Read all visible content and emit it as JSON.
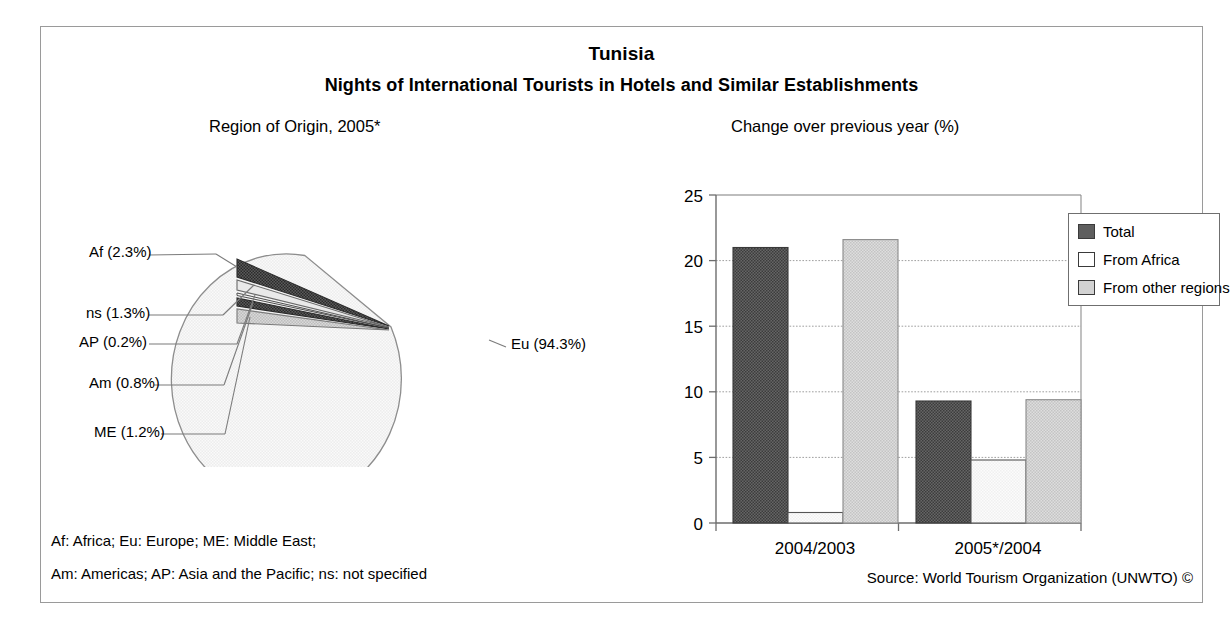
{
  "header": {
    "country": "Tunisia",
    "subtitle": "Nights of International Tourists in Hotels and Similar Establishments"
  },
  "pie_panel": {
    "caption": "Region of Origin, 2005*",
    "labels": {
      "af": "Af (2.3%)",
      "ns": "ns (1.3%)",
      "ap": "AP (0.2%)",
      "am": "Am (0.8%)",
      "me": "ME (1.2%)",
      "eu": "Eu (94.3%)"
    }
  },
  "bar_panel": {
    "caption": "Change over previous year (%)",
    "legend": [
      {
        "label": "Total",
        "color": "#585858"
      },
      {
        "label": "From Africa",
        "color": "#ffffff"
      },
      {
        "label": "From other regions",
        "color": "#cfcfcf"
      }
    ]
  },
  "footer": {
    "note_line_1": "Af: Africa; Eu: Europe; ME: Middle East;",
    "note_line_2": "Am: Americas; AP: Asia and the Pacific; ns: not specified",
    "source": "Source: World Tourism Organization (UNWTO) ©"
  },
  "chart_data": [
    {
      "type": "pie",
      "title": "Region of Origin, 2005*",
      "categories": [
        "Eu",
        "Af",
        "ns",
        "ME",
        "Am",
        "AP"
      ],
      "labels": [
        "Eu (94.3%)",
        "Af (2.3%)",
        "ns (1.3%)",
        "ME (1.2%)",
        "Am (0.8%)",
        "AP (0.2%)"
      ],
      "values": [
        94.3,
        2.3,
        1.3,
        1.2,
        0.8,
        0.2
      ],
      "unit": "%",
      "colors": [
        "#f2f2f2",
        "#4a4a4a",
        "#d9d9d9",
        "#2e2e2e",
        "#9a9a9a",
        "#e6e6e6"
      ],
      "legend": "callout-labels",
      "note": "Af: Africa; Eu: Europe; ME: Middle East; Am: Americas; AP: Asia and the Pacific; ns: not specified"
    },
    {
      "type": "bar",
      "title": "Change over previous year (%)",
      "xlabel": "",
      "ylabel": "",
      "ylim": [
        0,
        25
      ],
      "yticks": [
        0,
        5,
        10,
        15,
        20,
        25
      ],
      "ytick_labels": [
        "0",
        "5",
        "10",
        "15",
        "20",
        "25"
      ],
      "grid": true,
      "legend_position": "right",
      "categories": [
        "2004/2003",
        "2005*/2004"
      ],
      "series": [
        {
          "name": "Total",
          "values": [
            21.0,
            9.3
          ],
          "color": "#585858"
        },
        {
          "name": "From Africa",
          "values": [
            0.8,
            4.8
          ],
          "color": "#ffffff"
        },
        {
          "name": "From other regions",
          "values": [
            21.6,
            9.4
          ],
          "color": "#cfcfcf"
        }
      ]
    }
  ]
}
